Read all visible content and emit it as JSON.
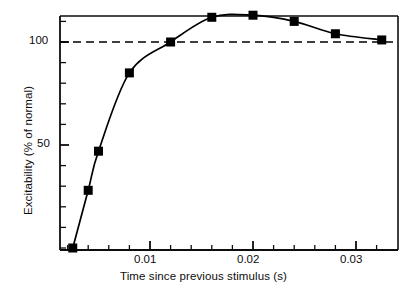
{
  "chart_data": {
    "type": "line",
    "title": "",
    "subtitle": "",
    "xlabel": "Time since previous stimulus (s)",
    "ylabel": "Excitability (% of normal)",
    "xlim": [
      0.0,
      0.0343
    ],
    "ylim": [
      0,
      120
    ],
    "grid": false,
    "legend": null,
    "x_ticks_major": [
      0.01,
      0.02,
      0.03
    ],
    "x_tick_labels": [
      "0.01",
      "0.02",
      "0.03"
    ],
    "x_minor_tick_step": 0.002,
    "y_ticks_major": [
      50,
      100
    ],
    "y_tick_labels": [
      "50",
      "100"
    ],
    "y_minor_tick_step": 10,
    "series": [
      {
        "name": "Excitability recovery curve",
        "marker": "filled-square",
        "line": "solid",
        "color": "#000000",
        "x": [
          0.0025,
          0.004,
          0.005,
          0.008,
          0.012,
          0.016,
          0.02,
          0.024,
          0.028,
          0.0325
        ],
        "values": [
          0,
          28,
          47,
          85,
          100,
          112,
          113,
          110,
          104,
          101
        ]
      }
    ],
    "annotations": [
      {
        "type": "reference-line",
        "name": "normal-excitability-line",
        "orientation": "horizontal",
        "value": 100,
        "style": "dashed",
        "color": "#000000"
      }
    ]
  },
  "axes": {
    "x_axis_name": "time-axis",
    "y_axis_name": "excitability-axis"
  }
}
